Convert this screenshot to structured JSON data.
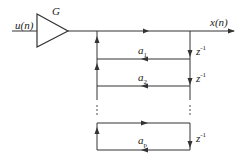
{
  "diagram": {
    "type": "signal-flow / all-pole AR filter block diagram",
    "input_label": "u(n)",
    "gain_label": "G",
    "output_label": "x(n)",
    "coefficients": [
      {
        "base": "a",
        "sub": "1"
      },
      {
        "base": "a",
        "sub": "2"
      },
      {
        "base": "a",
        "sub": "p"
      }
    ],
    "delay_labels": [
      {
        "base": "z",
        "sup": "-1"
      },
      {
        "base": "z",
        "sup": "-1"
      },
      {
        "base": "z",
        "sup": "-1"
      }
    ],
    "ellipsis": "⋮",
    "colors": {
      "line": "#333333",
      "background": "#ffffff"
    }
  }
}
